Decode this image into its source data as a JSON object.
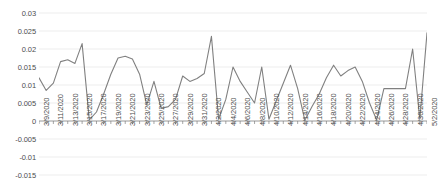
{
  "chart_data": {
    "type": "line",
    "title": "",
    "xlabel": "",
    "ylabel": "",
    "grid": true,
    "legend": false,
    "line_color": "#808080",
    "axis_color": "#808080",
    "grid_color": "#e8e8e8",
    "label_color": "#4d4d4d",
    "ylim": [
      -0.015,
      0.03
    ],
    "yticks": [
      0.03,
      0.025,
      0.02,
      0.015,
      0.01,
      0.005,
      0,
      -0.005,
      -0.01,
      -0.015
    ],
    "ytick_labels": [
      "0.03",
      "0.025",
      "0.02",
      "0.015",
      "0.01",
      "0.005",
      "0",
      "-0.005",
      "-0.01",
      "-0.015"
    ],
    "xtick_labels": [
      "3/9/2020",
      "3/11/2020",
      "3/13/2020",
      "3/15/2020",
      "3/17/2020",
      "3/19/2020",
      "3/21/2020",
      "3/23/2020",
      "3/25/2020",
      "3/27/2020",
      "3/29/2020",
      "3/31/2020",
      "4/2/2020",
      "4/4/2020",
      "4/6/2020",
      "4/8/2020",
      "4/10/2020",
      "4/12/2020",
      "4/14/2020",
      "4/16/2020",
      "4/18/2020",
      "4/20/2020",
      "4/22/2020",
      "4/24/2020",
      "4/26/2020",
      "4/28/2020",
      "4/30/2020",
      "5/2/2020"
    ],
    "x": [
      "3/9/2020",
      "3/10/2020",
      "3/11/2020",
      "3/12/2020",
      "3/13/2020",
      "3/14/2020",
      "3/15/2020",
      "3/16/2020",
      "3/17/2020",
      "3/18/2020",
      "3/19/2020",
      "3/20/2020",
      "3/21/2020",
      "3/22/2020",
      "3/23/2020",
      "3/24/2020",
      "3/25/2020",
      "3/26/2020",
      "3/27/2020",
      "3/28/2020",
      "3/29/2020",
      "3/30/2020",
      "3/31/2020",
      "4/1/2020",
      "4/2/2020",
      "4/3/2020",
      "4/4/2020",
      "4/5/2020",
      "4/6/2020",
      "4/7/2020",
      "4/8/2020",
      "4/9/2020",
      "4/10/2020",
      "4/11/2020",
      "4/12/2020",
      "4/13/2020",
      "4/14/2020",
      "4/15/2020",
      "4/16/2020",
      "4/17/2020",
      "4/18/2020",
      "4/19/2020",
      "4/20/2020",
      "4/21/2020",
      "4/22/2020",
      "4/23/2020",
      "4/24/2020",
      "4/25/2020",
      "4/26/2020",
      "4/27/2020",
      "4/28/2020",
      "4/29/2020",
      "4/30/2020",
      "5/1/2020",
      "5/2/2020"
    ],
    "values": [
      0.012,
      0.0085,
      0.0105,
      0.0165,
      0.017,
      0.016,
      0.0215,
      0.0003,
      0.0025,
      0.0075,
      0.013,
      0.0175,
      0.018,
      0.0172,
      0.013,
      0.0045,
      0.011,
      0.0035,
      0.004,
      0.006,
      0.0125,
      0.011,
      0.0118,
      0.0132,
      0.0235,
      0.0005,
      0.006,
      0.015,
      0.011,
      0.008,
      0.005,
      0.015,
      0.0005,
      0.0055,
      0.0105,
      0.0155,
      0.009,
      0.0002,
      0.004,
      0.0075,
      0.012,
      0.0155,
      0.0125,
      0.014,
      0.015,
      0.011,
      0.005,
      0.0003,
      0.009,
      0.009,
      0.009,
      0.009,
      0.02,
      0.0005,
      0.0245
    ]
  }
}
